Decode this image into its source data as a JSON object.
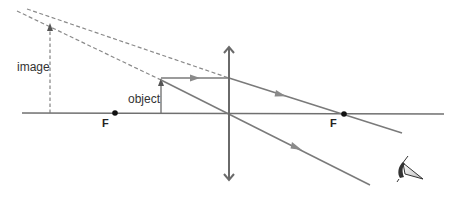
{
  "diagram": {
    "labels": {
      "image": "image",
      "object": "object",
      "focal_left": "F",
      "focal_right": "F"
    },
    "elements": {
      "principal_axis": "principal axis",
      "lens": "converging lens",
      "object_arrow": "object arrow",
      "virtual_image_arrow": "virtual image arrow (dashed)",
      "ray_parallel": "ray parallel to axis refracted through F",
      "ray_center": "ray through optical centre",
      "virtual_rays": "dashed back-extended rays",
      "eye": "observer eye"
    },
    "colors": {
      "ray": "#7a7a7a",
      "dashed": "#8a8a8a",
      "axis": "#707070",
      "lens": "#6a6a6a",
      "dot": "#111111",
      "text": "#333333"
    }
  }
}
